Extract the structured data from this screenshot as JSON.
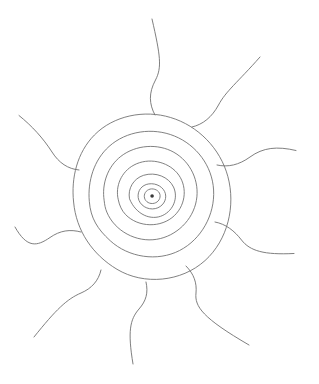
{
  "image": {
    "title": "Hand-drawn sun with concentric rings and wavy rays",
    "subject": "sun-motif",
    "medium": "pencil line drawing",
    "width": 319,
    "height": 384,
    "background_color": "#ffffff",
    "line_color": "#6e6e6e",
    "line_width": 0.9
  },
  "composition": {
    "center_x": 152,
    "center_y": 196,
    "ring_count": 7,
    "ray_count": 9,
    "has_center_dot": true
  },
  "rings": [
    {
      "name": "center-dot",
      "radius_x": 1.8,
      "radius_y": 1.8,
      "filled": true,
      "path": "M 150.3 196.0 A 1.8 1.8 0 1 1 153.9 196.0 A 1.8 1.8 0 1 1 150.3 196.0 Z"
    },
    {
      "name": "ring-1",
      "radius_x": 8,
      "radius_y": 7,
      "path": "M 144.3 196.6 C 144.1 192.6 147.3 189.1 151.6 188.9 C 156.2 188.7 159.9 191.8 160.1 195.6 C 160.3 199.6 157.2 203.2 152.7 203.5 C 148.2 203.8 144.5 200.6 144.3 196.6 Z"
    },
    {
      "name": "ring-2",
      "radius_x": 14,
      "radius_y": 12.5,
      "path": "M 138.2 197.6 C 137.3 191.0 141.6 184.9 148.8 183.9 C 156.6 182.8 163.8 187.3 165.4 193.7 C 167.0 200.2 162.6 207.0 155.3 208.6 C 147.6 210.3 139.3 205.3 138.2 197.6 Z"
    },
    {
      "name": "ring-3",
      "radius_x": 23,
      "radius_y": 20,
      "path": "M 129.5 198.8 C 127.6 188.6 133.5 178.5 143.6 175.3 C 155.6 171.5 168.8 177.0 173.5 187.0 C 178.4 197.5 173.6 210.2 162.8 215.4 C 151.1 221.0 136.0 214.7 129.5 198.8 Z"
    },
    {
      "name": "ring-4",
      "radius_x": 34,
      "radius_y": 30,
      "path": "M 118.3 199.8 C 115.0 186.3 121.3 171.7 134.0 165.0 C 148.5 157.3 167.1 161.4 177.0 172.8 C 187.5 184.9 186.5 203.9 174.5 215.5 C 161.4 228.2 138.3 227.7 125.6 214.6 C 121.8 210.7 119.4 205.4 118.3 199.8 Z"
    },
    {
      "name": "ring-5",
      "radius_x": 48,
      "radius_y": 43,
      "path": "M 104.2 200.8 C 101.5 183.8 107.8 166.5 120.8 156.4 C 136.0 144.6 158.0 143.3 173.9 152.3 C 190.8 161.9 199.8 181.5 196.4 200.4 C 192.9 220.1 176.4 236.1 156.7 239.3 C 136.4 242.6 114.8 231.2 106.8 212.1 C 105.3 208.5 104.6 204.7 104.2 200.8 Z"
    },
    {
      "name": "ring-6",
      "radius_x": 63,
      "radius_y": 57,
      "path": "M 89.3 201.3 C 87.5 181.1 94.0 160.0 109.0 146.5 C 126.4 130.8 152.8 127.2 174.4 136.0 C 196.5 145.0 212.3 166.0 213.6 190.0 C 215.0 214.6 201.4 239.3 179.6 250.5 C 157.3 262.0 128.5 257.5 110.2 240.7 C 97.5 229.1 90.6 218.2 89.3 201.3 Z"
    },
    {
      "name": "ring-7-outer",
      "radius_x": 79,
      "radius_y": 72,
      "path": "M 73.6 202.0 C 71.0 178.0 77.1 152.5 94.4 135.0 C 113.6 115.5 144.3 109.5 170.6 117.5 C 198.2 125.8 220.3 148.6 227.8 176.3 C 235.9 206.0 227.8 240.0 205.0 260.6 C 181.3 282.0 144.0 285.5 117.0 269.3 C 92.6 254.7 76.2 230.8 73.6 202.0 Z"
    }
  ],
  "rays": [
    {
      "name": "ray-north",
      "direction": "north",
      "path": "M 155.0 115.0 C 149.0 104.0 148.5 93.0 155.5 80.0 C 162.0 67.5 160.5 56.0 152.0 19.0"
    },
    {
      "name": "ray-northeast",
      "direction": "northeast",
      "path": "M 192.0 127.0 C 203.0 124.5 212.0 117.0 218.5 105.0 C 226.0 91.0 237.0 83.0 260.0 57.0"
    },
    {
      "name": "ray-east-upper",
      "direction": "east-upper",
      "path": "M 217.0 165.0 C 228.0 167.5 239.0 165.0 250.0 157.0 C 263.0 147.5 277.0 146.0 296.0 150.5"
    },
    {
      "name": "ray-east-lower",
      "direction": "east-lower",
      "path": "M 215.0 222.0 C 226.0 224.0 234.5 231.0 241.5 240.0 C 250.0 251.0 264.0 255.0 294.0 253.5"
    },
    {
      "name": "ray-southeast",
      "direction": "southeast",
      "path": "M 186.0 266.0 C 194.0 274.0 197.0 283.0 196.0 293.0 C 194.5 306.5 202.5 318.0 249.0 345.0"
    },
    {
      "name": "ray-south",
      "direction": "south",
      "path": "M 146.0 282.0 C 148.5 293.0 146.0 301.0 139.0 309.0 C 130.0 319.5 127.5 331.0 133.0 364.0"
    },
    {
      "name": "ray-southwest",
      "direction": "southwest",
      "path": "M 101.0 270.0 C 98.5 281.0 91.5 288.5 81.0 293.0 C 67.0 299.0 56.0 309.5 34.0 337.0"
    },
    {
      "name": "ray-west-lower",
      "direction": "west-lower",
      "path": "M 81.0 232.0 C 70.0 229.0 60.0 230.5 50.0 237.5 C 37.0 246.5 27.0 248.5 15.0 227.0"
    },
    {
      "name": "ray-west-upper",
      "direction": "west-upper",
      "path": "M 79.0 170.0 C 68.0 169.0 59.0 163.0 52.0 152.0 C 43.0 138.0 32.0 126.0 19.0 115.5"
    }
  ]
}
